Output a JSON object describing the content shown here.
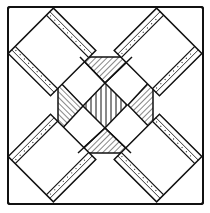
{
  "figure": {
    "caption": "Quilt block pattern: X cross of striped strips with hatched triangles",
    "kind": "quilt-block-line-drawing",
    "colors": {
      "ink": "#111111",
      "paper": "#ffffff"
    },
    "frame": {
      "x": 8,
      "y": 7,
      "width": 195,
      "height": 197
    },
    "center": {
      "x": 105,
      "y": 105
    },
    "bands": [
      {
        "name": "diagonal-band-tl-br",
        "angle_deg": 45,
        "half_width": 32,
        "strip_width": 10
      },
      {
        "name": "diagonal-band-tr-bl",
        "angle_deg": -45,
        "half_width": 32,
        "strip_width": 10
      }
    ],
    "triangles": [
      {
        "name": "top",
        "pattern": "diagonal-hatch"
      },
      {
        "name": "right",
        "pattern": "diagonal-hatch"
      },
      {
        "name": "bottom",
        "pattern": "diagonal-hatch"
      },
      {
        "name": "left",
        "pattern": "diagonal-hatch"
      }
    ],
    "center_diamond": {
      "pattern": "vertical-hatch-with-dots"
    }
  }
}
